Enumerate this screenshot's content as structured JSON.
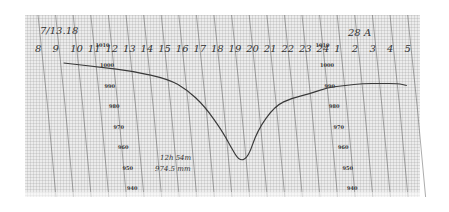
{
  "chart_data": {
    "type": "line",
    "title": "",
    "subtitle": "Barograph trace",
    "xlabel": "Hour",
    "ylabel": "Pressure (hPa)",
    "date_label_left": "7/13.18",
    "date_label_right": "28 A",
    "x_tick_labels": [
      "8",
      "9",
      "10",
      "11",
      "12",
      "13",
      "14",
      "15",
      "16",
      "17",
      "18",
      "19",
      "20",
      "21",
      "22",
      "23",
      "24",
      "1",
      "2",
      "3",
      "4",
      "5"
    ],
    "y_tick_labels_left": [
      "1010",
      "1000",
      "990",
      "980",
      "970",
      "960",
      "950",
      "940"
    ],
    "y_tick_labels_right": [
      "1010",
      "1000",
      "990",
      "980",
      "970",
      "960",
      "950",
      "940"
    ],
    "ylim": [
      940,
      1010
    ],
    "grid": true,
    "legend": null,
    "series": [
      {
        "name": "Pressure",
        "x": [
          "9",
          "11",
          "13",
          "15",
          "16",
          "17",
          "18",
          "18.5",
          "19",
          "19.5",
          "20",
          "21",
          "22",
          "23",
          "24",
          "1",
          "2",
          "3",
          "4",
          "4.5"
        ],
        "values": [
          1001,
          999,
          997,
          993,
          988,
          980,
          968,
          960,
          953,
          955,
          968,
          980,
          984,
          986,
          989,
          990,
          991,
          991,
          991,
          990
        ]
      }
    ],
    "annotations": [
      "12h 54m",
      "974.5 mm"
    ],
    "minimum": {
      "x": "19",
      "value": 953
    }
  },
  "labels": {
    "date_left": "7/13.18",
    "date_right": "28 A",
    "note_line1": "12h 54m",
    "note_line2": "974.5 mm"
  },
  "colors": {
    "paper": "#e9e9e9",
    "grid": "#8a8a8a",
    "trace": "#3a3a3a",
    "ink": "#333333"
  }
}
